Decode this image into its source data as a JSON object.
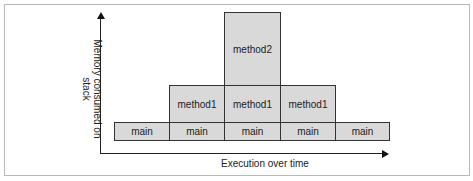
{
  "diagram": {
    "y_axis_label": "Memory consumed on stack",
    "x_axis_label": "Execution over time",
    "colors": {
      "block_fill": "#d9d9d9",
      "block_border": "#333333",
      "axis": "#222222"
    },
    "columns": [
      {
        "stack": [
          "main"
        ]
      },
      {
        "stack": [
          "main",
          "method1"
        ]
      },
      {
        "stack": [
          "main",
          "method1",
          "method2"
        ]
      },
      {
        "stack": [
          "main",
          "method1"
        ]
      },
      {
        "stack": [
          "main"
        ]
      }
    ],
    "blocks": {
      "main": [
        "main",
        "main",
        "main",
        "main",
        "main"
      ],
      "method1": [
        "method1",
        "method1",
        "method1"
      ],
      "method2": [
        "method2"
      ]
    }
  }
}
